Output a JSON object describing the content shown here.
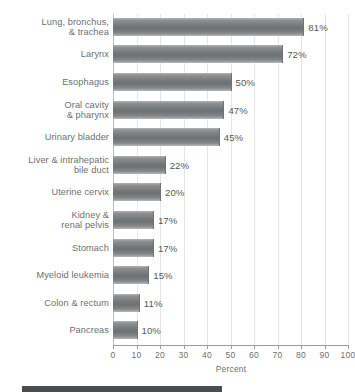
{
  "chart_data": {
    "type": "bar",
    "orientation": "horizontal",
    "title": "",
    "xlabel": "Percent",
    "ylabel": "",
    "xlim": [
      0,
      100
    ],
    "xticks": [
      0,
      10,
      20,
      30,
      40,
      50,
      60,
      70,
      80,
      90,
      100
    ],
    "xtick_labels": [
      "0",
      "10",
      "20",
      "30",
      "40",
      "50",
      "60",
      "70",
      "80",
      "90",
      "100"
    ],
    "grid": "vertical",
    "legend": "none",
    "bar_color": "#76797b",
    "categories": [
      "Lung, bronchus,\n& trachea",
      "Larynx",
      "Esophagus",
      "Oral cavity\n& pharynx",
      "Urinary bladder",
      "Liver & intrahepatic\nbile duct",
      "Uterine cervix",
      "Kidney &\nrenal pelvis",
      "Stomach",
      "Myeloid leukemia",
      "Colon & rectum",
      "Pancreas"
    ],
    "values": [
      81,
      72,
      50,
      47,
      45,
      22,
      20,
      17,
      17,
      15,
      11,
      10
    ],
    "value_labels": [
      "81%",
      "72%",
      "50%",
      "47%",
      "45%",
      "22%",
      "20%",
      "17%",
      "17%",
      "15%",
      "11%",
      "10%"
    ]
  }
}
